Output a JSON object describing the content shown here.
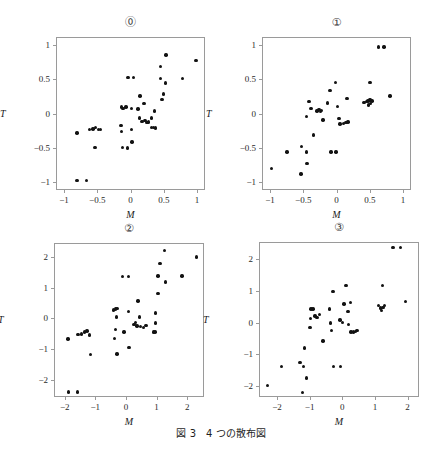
{
  "figure": {
    "caption": "図 3　4 つの散布図",
    "background_color": "#ffffff",
    "point_color": "#121212",
    "frame_color": "#9a9a9a",
    "width": 442,
    "height": 465
  },
  "chart_data": [
    {
      "type": "scatter",
      "title": "⓪",
      "xlabel": "M",
      "ylabel": "T",
      "xlim": [
        -1.12,
        1.12
      ],
      "ylim": [
        -1.12,
        1.12
      ],
      "xticks": [
        -1,
        -0.5,
        0,
        0.5,
        1
      ],
      "xticklabels": [
        "−1",
        "−0.5",
        "0",
        "0.5",
        "1"
      ],
      "yticks": [
        -1,
        -0.5,
        0,
        0.5,
        1
      ],
      "yticklabels": [
        "−1",
        "−0.5",
        "0",
        "0.5",
        "1"
      ],
      "grid": false,
      "legend": "none",
      "box": {
        "left": 56,
        "top": 37,
        "width": 149,
        "height": 153
      },
      "points": [
        [
          -0.82,
          -0.97
        ],
        [
          -0.68,
          -0.97
        ],
        [
          -0.82,
          -0.27
        ],
        [
          -0.63,
          -0.22
        ],
        [
          -0.58,
          -0.21
        ],
        [
          -0.54,
          -0.19
        ],
        [
          -0.5,
          -0.22
        ],
        [
          -0.47,
          -0.22
        ],
        [
          -0.55,
          -0.48
        ],
        [
          -0.15,
          0.11
        ],
        [
          -0.13,
          0.09
        ],
        [
          -0.08,
          0.11
        ],
        [
          -0.16,
          -0.16
        ],
        [
          -0.15,
          -0.25
        ],
        [
          -0.14,
          -0.48
        ],
        [
          -0.05,
          0.54
        ],
        [
          0.03,
          0.54
        ],
        [
          0.0,
          0.09
        ],
        [
          0.0,
          -0.22
        ],
        [
          0.01,
          -0.4
        ],
        [
          -0.06,
          -0.49
        ],
        [
          0.1,
          0.08
        ],
        [
          0.12,
          -0.05
        ],
        [
          0.16,
          -0.1
        ],
        [
          0.19,
          0.16
        ],
        [
          0.2,
          -0.09
        ],
        [
          0.23,
          -0.12
        ],
        [
          0.26,
          -0.11
        ],
        [
          0.3,
          -0.05
        ],
        [
          0.3,
          -0.19
        ],
        [
          0.33,
          -0.19
        ],
        [
          0.36,
          -0.2
        ],
        [
          0.13,
          0.27
        ],
        [
          0.35,
          0.05
        ],
        [
          0.44,
          0.53
        ],
        [
          0.46,
          0.22
        ],
        [
          0.48,
          0.3
        ],
        [
          0.44,
          0.7
        ],
        [
          0.51,
          0.46
        ],
        [
          0.52,
          0.87
        ],
        [
          0.77,
          0.53
        ],
        [
          0.97,
          0.79
        ]
      ]
    },
    {
      "type": "scatter",
      "title": "①",
      "xlabel": "M",
      "ylabel": "T",
      "xlim": [
        -1.12,
        1.12
      ],
      "ylim": [
        -1.12,
        1.12
      ],
      "xticks": [
        -1,
        -0.5,
        0,
        0.5,
        1
      ],
      "xticklabels": [
        "−1",
        "−0.5",
        "0",
        "0.5",
        "1"
      ],
      "yticks": [
        -1,
        -0.5,
        0,
        0.5,
        1
      ],
      "yticklabels": [
        "−1",
        "−0.5",
        "0",
        "0.5",
        "1"
      ],
      "grid": false,
      "legend": "none",
      "box": {
        "left": 262,
        "top": 37,
        "width": 149,
        "height": 153
      },
      "points": [
        [
          -0.99,
          -0.79
        ],
        [
          -0.76,
          -0.55
        ],
        [
          -0.55,
          -0.87
        ],
        [
          -0.54,
          -0.47
        ],
        [
          -0.47,
          -0.55
        ],
        [
          -0.46,
          -0.72
        ],
        [
          -0.44,
          0.19
        ],
        [
          -0.42,
          0.19
        ],
        [
          -0.47,
          -0.03
        ],
        [
          -0.4,
          0.09
        ],
        [
          -0.36,
          -0.3
        ],
        [
          -0.31,
          0.05
        ],
        [
          -0.28,
          0.07
        ],
        [
          -0.26,
          0.04
        ],
        [
          -0.24,
          0.06
        ],
        [
          -0.22,
          -0.08
        ],
        [
          -0.15,
          0.17
        ],
        [
          -0.11,
          0.35
        ],
        [
          -0.1,
          -0.55
        ],
        [
          -0.02,
          -0.55
        ],
        [
          -0.03,
          0.47
        ],
        [
          0.0,
          0.12
        ],
        [
          0.02,
          -0.06
        ],
        [
          0.04,
          -0.14
        ],
        [
          0.09,
          -0.13
        ],
        [
          0.13,
          -0.12
        ],
        [
          0.14,
          0.23
        ],
        [
          0.16,
          -0.11
        ],
        [
          0.4,
          0.18
        ],
        [
          0.44,
          0.19
        ],
        [
          0.46,
          0.2
        ],
        [
          0.47,
          0.14
        ],
        [
          0.49,
          0.22
        ],
        [
          0.5,
          0.16
        ],
        [
          0.52,
          0.2
        ],
        [
          0.49,
          0.47
        ],
        [
          0.62,
          0.99
        ],
        [
          0.7,
          0.99
        ],
        [
          0.79,
          0.27
        ]
      ]
    },
    {
      "type": "scatter",
      "title": "②",
      "xlabel": "M",
      "ylabel": "T",
      "xlim": [
        -2.35,
        2.55
      ],
      "ylim": [
        -2.55,
        2.45
      ],
      "xticks": [
        -2,
        -1,
        0,
        1,
        2
      ],
      "xticklabels": [
        "−2",
        "−1",
        "0",
        "1",
        "2"
      ],
      "yticks": [
        -2,
        -1,
        0,
        1,
        2
      ],
      "yticklabels": [
        "−2",
        "−1",
        "0",
        "1",
        "2"
      ],
      "grid": false,
      "legend": "none",
      "box": {
        "left": 54,
        "top": 243,
        "width": 150,
        "height": 154
      },
      "points": [
        [
          -1.9,
          -2.35
        ],
        [
          -1.62,
          -2.35
        ],
        [
          -1.93,
          -0.63
        ],
        [
          -1.6,
          -0.49
        ],
        [
          -1.48,
          -0.47
        ],
        [
          -1.38,
          -0.41
        ],
        [
          -1.3,
          -0.38
        ],
        [
          -1.22,
          -0.51
        ],
        [
          -1.2,
          -1.13
        ],
        [
          -0.43,
          0.31
        ],
        [
          -0.38,
          0.34
        ],
        [
          -0.33,
          0.36
        ],
        [
          -0.34,
          0.08
        ],
        [
          -0.37,
          -0.33
        ],
        [
          -0.4,
          -0.62
        ],
        [
          -0.33,
          -1.12
        ],
        [
          -0.14,
          1.4
        ],
        [
          0.06,
          1.4
        ],
        [
          -0.09,
          -0.41
        ],
        [
          0.05,
          0.25
        ],
        [
          0.07,
          -0.92
        ],
        [
          0.23,
          -0.16
        ],
        [
          0.28,
          -0.09
        ],
        [
          0.33,
          -0.21
        ],
        [
          0.36,
          0.6
        ],
        [
          0.41,
          0.08
        ],
        [
          0.45,
          -0.22
        ],
        [
          0.54,
          -0.27
        ],
        [
          0.62,
          -0.19
        ],
        [
          0.86,
          -0.41
        ],
        [
          0.92,
          -0.41
        ],
        [
          0.93,
          0.21
        ],
        [
          0.94,
          -0.11
        ],
        [
          1.02,
          0.85
        ],
        [
          1.08,
          1.81
        ],
        [
          1.02,
          1.41
        ],
        [
          1.23,
          2.23
        ],
        [
          1.25,
          1.22
        ],
        [
          1.8,
          1.41
        ],
        [
          2.28,
          2.03
        ]
      ]
    },
    {
      "type": "scatter",
      "title": "③",
      "xlabel": "M",
      "ylabel": "T",
      "xlim": [
        -2.55,
        2.35
      ],
      "ylim": [
        -2.35,
        2.55
      ],
      "xticks": [
        -2,
        -1,
        0,
        1,
        2
      ],
      "xticklabels": [
        "−2",
        "−1",
        "0",
        "1",
        "2"
      ],
      "yticks": [
        -2,
        -1,
        0,
        1,
        2
      ],
      "yticklabels": [
        "−2",
        "−1",
        "0",
        "1",
        "2"
      ],
      "grid": false,
      "legend": "none",
      "box": {
        "left": 259,
        "top": 242,
        "width": 160,
        "height": 155
      },
      "points": [
        [
          -2.32,
          -1.96
        ],
        [
          -1.9,
          -1.35
        ],
        [
          -1.32,
          -1.22
        ],
        [
          -1.22,
          -1.35
        ],
        [
          -1.25,
          -2.18
        ],
        [
          -1.12,
          -1.72
        ],
        [
          -1.18,
          -0.77
        ],
        [
          -0.99,
          0.46
        ],
        [
          -0.93,
          0.46
        ],
        [
          -1.0,
          0.16
        ],
        [
          -1.02,
          -0.12
        ],
        [
          -0.86,
          0.24
        ],
        [
          -0.8,
          0.2
        ],
        [
          -0.72,
          0.29
        ],
        [
          -0.62,
          -0.55
        ],
        [
          -0.42,
          0.46
        ],
        [
          -0.4,
          0.02
        ],
        [
          -0.36,
          -0.22
        ],
        [
          -0.32,
          1.02
        ],
        [
          -0.3,
          -1.35
        ],
        [
          -0.08,
          -1.35
        ],
        [
          -0.1,
          0.12
        ],
        [
          -0.02,
          0.04
        ],
        [
          0.02,
          0.62
        ],
        [
          0.08,
          1.2
        ],
        [
          0.14,
          0.38
        ],
        [
          0.16,
          -0.02
        ],
        [
          0.22,
          0.66
        ],
        [
          0.24,
          -0.26
        ],
        [
          0.32,
          -0.26
        ],
        [
          0.38,
          -0.24
        ],
        [
          0.42,
          -0.22
        ],
        [
          1.08,
          0.58
        ],
        [
          1.14,
          0.5
        ],
        [
          1.18,
          0.42
        ],
        [
          1.22,
          0.52
        ],
        [
          1.26,
          0.58
        ],
        [
          1.2,
          1.2
        ],
        [
          1.52,
          2.4
        ],
        [
          1.76,
          2.4
        ],
        [
          1.9,
          0.7
        ]
      ]
    }
  ]
}
